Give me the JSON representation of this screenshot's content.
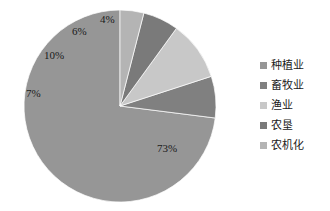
{
  "chart_data": {
    "type": "pie",
    "title": "",
    "labels": [
      "种植业",
      "畜牧业",
      "渔业",
      "农垦",
      "农机化"
    ],
    "values": [
      73,
      7,
      10,
      6,
      4
    ],
    "value_labels": [
      "73%",
      "7%",
      "10%",
      "6%",
      "4%"
    ],
    "colors": [
      "#969696",
      "#808080",
      "#c8c8c8",
      "#7a7a7a",
      "#b4b4b4"
    ],
    "unit": "%",
    "legend_position": "right",
    "grid": false,
    "start_angle_deg": 0,
    "direction": "counterclockwise",
    "background": "#ffffff",
    "slices": [
      {
        "label": "种植业",
        "value": 73,
        "value_label": "73%",
        "color": "#969696"
      },
      {
        "label": "畜牧业",
        "value": 7,
        "value_label": "7%",
        "color": "#808080"
      },
      {
        "label": "渔业",
        "value": 10,
        "value_label": "10%",
        "color": "#c8c8c8"
      },
      {
        "label": "农垦",
        "value": 6,
        "value_label": "6%",
        "color": "#7a7a7a"
      },
      {
        "label": "农机化",
        "value": 4,
        "value_label": "4%",
        "color": "#b4b4b4"
      }
    ]
  },
  "legend": {
    "items": [
      {
        "label": "种植业",
        "color": "#969696"
      },
      {
        "label": "畜牧业",
        "color": "#808080"
      },
      {
        "label": "渔业",
        "color": "#c8c8c8"
      },
      {
        "label": "农垦",
        "color": "#7a7a7a"
      },
      {
        "label": "农机化",
        "color": "#b4b4b4"
      }
    ]
  },
  "labels_on_chart": {
    "main": "73%",
    "second": "7%",
    "third": "10%",
    "fourth": "6%",
    "fifth": "4%"
  }
}
